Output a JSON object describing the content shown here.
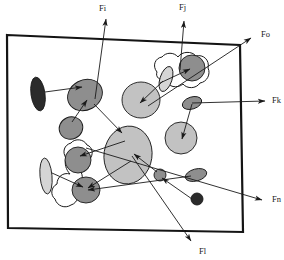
{
  "figure": {
    "name": "force-vector-blob-diagram",
    "background_color": "#ffffff",
    "frame": {
      "name": "bounding-frame",
      "stroke_color": "#141414",
      "stroke_width": 2.2,
      "fill": "#ffffff",
      "points": "7,35 240,45 243,232 8,228"
    },
    "colors": {
      "dark_fill": "#2b2b2b",
      "mid_gray_fill": "#8e8e8e",
      "light_gray_fill": "#c2c2c2",
      "pale_gray_fill": "#d5d5d5",
      "outline": "#1a1a1a",
      "arrow": "#1a1a1a",
      "contour_fill": "#ffffff"
    }
  },
  "labels": [
    {
      "id": "Fi",
      "text": "Fi",
      "x": 99,
      "y": 11
    },
    {
      "id": "Fj",
      "text": "Fj",
      "x": 179,
      "y": 10
    },
    {
      "id": "Fo",
      "text": "Fo",
      "x": 261,
      "y": 37
    },
    {
      "id": "Fk",
      "text": "Fk",
      "x": 272,
      "y": 103
    },
    {
      "id": "Fn",
      "text": "Fn",
      "x": 272,
      "y": 202
    },
    {
      "id": "Fl",
      "text": "Fl",
      "x": 199,
      "y": 254
    }
  ],
  "contours": [
    {
      "name": "contour-blob-upper-right",
      "path": "M 157 72 C 152 66 155 58 162 57 C 166 52 174 52 178 57 C 182 51 192 51 196 56 C 203 54 210 60 208 68 C 211 74 207 82 200 83 C 196 89 187 89 183 84 C 177 89 168 87 166 80 C 160 81 155 77 157 72 Z"
    },
    {
      "name": "contour-blob-lower-left",
      "path": "M 66 158 C 62 152 64 145 71 143 C 75 138 84 139 87 145 C 93 147 94 155 89 160 C 91 166 87 172 81 172 C 84 178 82 186 75 189 C 80 194 78 203 71 205 C 65 209 57 206 55 199 C 50 195 51 187 57 184 C 57 177 63 172 70 174 C 66 170 64 163 66 158 Z"
    }
  ],
  "shapes": [
    {
      "name": "ellipse-dark-left-upper",
      "type": "ellipse",
      "cx": 38,
      "cy": 94,
      "rx": 7,
      "ry": 17,
      "rotate": -8,
      "fill": "dark_fill"
    },
    {
      "name": "ellipse-mid-gray-left-main",
      "type": "ellipse",
      "cx": 85,
      "cy": 95,
      "rx": 18,
      "ry": 15,
      "rotate": -28,
      "fill": "mid_gray_fill"
    },
    {
      "name": "ellipse-mid-gray-left-lower",
      "type": "ellipse",
      "cx": 71,
      "cy": 128,
      "rx": 12,
      "ry": 11,
      "rotate": -25,
      "fill": "mid_gray_fill"
    },
    {
      "name": "ellipse-pale-left-bottom",
      "type": "ellipse",
      "cx": 46,
      "cy": 176,
      "rx": 6,
      "ry": 18,
      "rotate": -5,
      "fill": "pale_gray_fill"
    },
    {
      "name": "ellipse-mid-gray-lower-left-upper",
      "type": "ellipse",
      "cx": 78,
      "cy": 160,
      "rx": 13,
      "ry": 13,
      "rotate": 0,
      "fill": "mid_gray_fill"
    },
    {
      "name": "ellipse-mid-gray-lower-left-lower",
      "type": "ellipse",
      "cx": 86,
      "cy": 190,
      "rx": 14,
      "ry": 13,
      "rotate": 0,
      "fill": "mid_gray_fill"
    },
    {
      "name": "ellipse-light-center-large",
      "type": "ellipse",
      "cx": 128,
      "cy": 155,
      "rx": 24,
      "ry": 29,
      "rotate": 8,
      "fill": "light_gray_fill"
    },
    {
      "name": "ellipse-light-mid-upper",
      "type": "ellipse",
      "cx": 141,
      "cy": 100,
      "rx": 19,
      "ry": 18,
      "rotate": 0,
      "fill": "light_gray_fill"
    },
    {
      "name": "ellipse-light-right-mid",
      "type": "ellipse",
      "cx": 181,
      "cy": 138,
      "rx": 16,
      "ry": 16,
      "rotate": 0,
      "fill": "light_gray_fill"
    },
    {
      "name": "ellipse-mid-gray-upper-right-circle",
      "type": "ellipse",
      "cx": 192,
      "cy": 68,
      "rx": 13,
      "ry": 13,
      "rotate": 0,
      "fill": "mid_gray_fill"
    },
    {
      "name": "ellipse-light-upper-right-small",
      "type": "ellipse",
      "cx": 166,
      "cy": 79,
      "rx": 6,
      "ry": 13,
      "rotate": 18,
      "fill": "pale_gray_fill"
    },
    {
      "name": "ellipse-dark-gray-right-fk",
      "type": "ellipse",
      "cx": 192,
      "cy": 103,
      "rx": 10,
      "ry": 6,
      "rotate": -18,
      "fill": "mid_gray_fill"
    },
    {
      "name": "ellipse-dark-gray-right-fn",
      "type": "ellipse",
      "cx": 196,
      "cy": 175,
      "rx": 11,
      "ry": 6,
      "rotate": -15,
      "fill": "mid_gray_fill"
    },
    {
      "name": "ellipse-small-mid-center",
      "type": "ellipse",
      "cx": 160,
      "cy": 175,
      "rx": 6,
      "ry": 6,
      "rotate": 0,
      "fill": "mid_gray_fill"
    },
    {
      "name": "circle-dark-small-bottom",
      "type": "ellipse",
      "cx": 197,
      "cy": 199,
      "rx": 6,
      "ry": 6,
      "rotate": 0,
      "fill": "dark_fill"
    }
  ],
  "arrows": [
    {
      "name": "arrow-fi-out",
      "from": [
        95,
        99
      ],
      "to": [
        106,
        19
      ],
      "head": "end"
    },
    {
      "name": "arrow-fj-out",
      "from": [
        180,
        70
      ],
      "to": [
        184,
        21
      ],
      "head": "end"
    },
    {
      "name": "arrow-fo-out",
      "from": [
        148,
        106
      ],
      "to": [
        251,
        38
      ],
      "head": "end"
    },
    {
      "name": "arrow-fk-out",
      "from": [
        192,
        103
      ],
      "to": [
        265,
        101
      ],
      "head": "end"
    },
    {
      "name": "arrow-fn-out",
      "from": [
        86,
        148
      ],
      "to": [
        262,
        200
      ],
      "head": "end"
    },
    {
      "name": "arrow-fl-out",
      "from": [
        132,
        156
      ],
      "to": [
        191,
        241
      ],
      "head": "end"
    },
    {
      "name": "arrow-dark-left-to-mid",
      "from": [
        45,
        92
      ],
      "to": [
        82,
        87
      ],
      "head": "end"
    },
    {
      "name": "arrow-lower-to-mid-left",
      "from": [
        72,
        122
      ],
      "to": [
        87,
        100
      ],
      "head": "end"
    },
    {
      "name": "arrow-mid-left-to-center",
      "from": [
        94,
        104
      ],
      "to": [
        122,
        133
      ],
      "head": "end"
    },
    {
      "name": "arrow-upper-right-small-to-circle",
      "from": [
        160,
        83
      ],
      "to": [
        190,
        69
      ],
      "head": "end"
    },
    {
      "name": "arrow-light-mid-upper-in",
      "from": [
        163,
        81
      ],
      "to": [
        140,
        103
      ],
      "head": "end"
    },
    {
      "name": "arrow-light-right-mid-up",
      "from": [
        182,
        139
      ],
      "to": [
        192,
        104
      ],
      "head": "start"
    },
    {
      "name": "arrow-lower-left-up-to-center",
      "from": [
        80,
        156
      ],
      "to": [
        125,
        141
      ],
      "head": "start"
    },
    {
      "name": "arrow-lower-left-lower-to-center",
      "from": [
        88,
        188
      ],
      "to": [
        131,
        161
      ],
      "head": "start"
    },
    {
      "name": "arrow-pale-bottom-to-blob",
      "from": [
        52,
        173
      ],
      "to": [
        83,
        187
      ],
      "head": "end"
    },
    {
      "name": "arrow-fn-ellipse-to-blob",
      "from": [
        191,
        176
      ],
      "to": [
        88,
        190
      ],
      "head": "end"
    },
    {
      "name": "arrow-dark-circle-to-small",
      "from": [
        192,
        199
      ],
      "to": [
        162,
        178
      ],
      "head": "end"
    },
    {
      "name": "arrow-small-center-to-big",
      "from": [
        157,
        172
      ],
      "to": [
        134,
        154
      ],
      "head": "end"
    }
  ]
}
